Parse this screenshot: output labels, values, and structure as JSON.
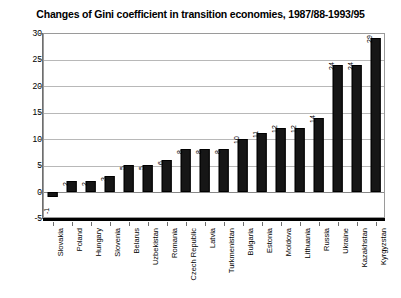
{
  "chart_data": {
    "type": "bar",
    "title": "Changes of Gini coefficient in transition economies, 1987/88-1993/95",
    "xlabel": "",
    "ylabel": "",
    "ylim": [
      -5,
      30
    ],
    "yticks": [
      30,
      25,
      20,
      15,
      10,
      5,
      0,
      -5
    ],
    "grid": true,
    "legend": "none",
    "orientation": "vertical",
    "bar_color": "#161616",
    "categories": [
      "Slovakia",
      "Poland",
      "Hungary",
      "Slovenia",
      "Belarus",
      "Uzbekistan",
      "Romania",
      "Czech Republic",
      "Latvia",
      "Turkmenistan",
      "Bulgaria",
      "Estonia",
      "Moldova",
      "Lithuania",
      "Russia",
      "Ukraine",
      "Kazakhstan",
      "Kyrgyzstan"
    ],
    "values": [
      -1,
      2,
      2,
      3,
      5,
      5,
      6,
      8,
      8,
      8,
      10,
      11,
      12,
      12,
      14,
      24,
      24,
      29
    ],
    "data_labels": [
      "-1",
      "2",
      "2",
      "3",
      "5",
      "5",
      "6",
      "8",
      "8",
      "8",
      "10",
      "11",
      "12",
      "12",
      "14",
      "24",
      "24",
      "29"
    ]
  }
}
